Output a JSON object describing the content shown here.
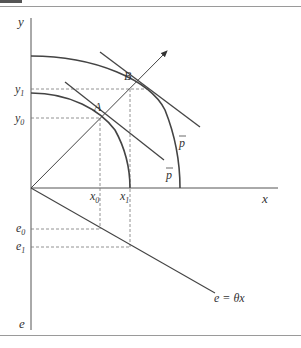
{
  "diagram": {
    "axes": {
      "y_label": "y",
      "x_label": "x",
      "e_label": "e"
    },
    "points": {
      "A": "A",
      "B": "B"
    },
    "ticks": {
      "y1": "y",
      "y1_sub": "1",
      "y0": "y",
      "y0_sub": "0",
      "x0": "x",
      "x0_sub": "0",
      "x1": "x",
      "x1_sub": "1",
      "e0": "e",
      "e0_sub": "0",
      "e1": "e",
      "e1_sub": "1"
    },
    "price_lines": {
      "outer": "p",
      "inner": "p"
    },
    "emission_line": "e = θx",
    "colors": {
      "line": "#444444",
      "dashed": "#777777",
      "frame": "#9a9a9a"
    }
  }
}
